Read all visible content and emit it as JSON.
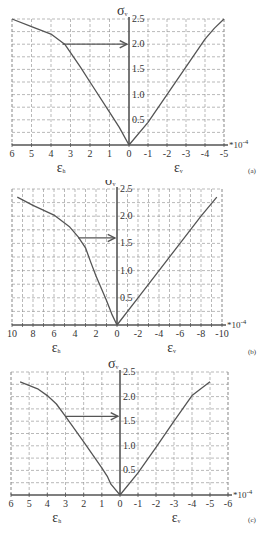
{
  "chart_data": [
    {
      "type": "line",
      "panel": "(a)",
      "title": "",
      "ylabel": "σv",
      "xlabel_left": "εh",
      "xlabel_right": "εv",
      "x_multiplier": "*10^-4",
      "xlim": [
        6,
        -5
      ],
      "ylim": [
        0,
        2.5
      ],
      "x_ticks": [
        6,
        5,
        4,
        3,
        2,
        1,
        0,
        -1,
        -2,
        -3,
        -4,
        -5
      ],
      "y_ticks": [
        0.5,
        1.0,
        1.5,
        2.0,
        2.5
      ],
      "grid": true,
      "grid_x_step": 1,
      "grid_y_step": 0.25,
      "series": [
        {
          "name": "εh",
          "x": [
            6,
            5,
            4,
            3.3,
            2.5,
            2,
            1,
            0.5,
            0
          ],
          "y": [
            2.5,
            2.35,
            2.2,
            2.0,
            1.55,
            1.25,
            0.65,
            0.35,
            0
          ]
        },
        {
          "name": "εv",
          "x": [
            0,
            -1,
            -2,
            -3,
            -4,
            -4.5,
            -5
          ],
          "y": [
            0,
            0.45,
            1.0,
            1.55,
            2.1,
            2.32,
            2.5
          ]
        }
      ],
      "annotations": [
        {
          "type": "arrow",
          "from": [
            3.4,
            2.0
          ],
          "to": [
            0,
            2.0
          ]
        }
      ]
    },
    {
      "type": "line",
      "panel": "(b)",
      "title": "",
      "ylabel": "σv",
      "xlabel_left": "εh",
      "xlabel_right": "εv",
      "x_multiplier": "*10^-4",
      "xlim": [
        10,
        -10
      ],
      "ylim": [
        0,
        2.5
      ],
      "x_ticks": [
        10,
        8,
        6,
        4,
        2,
        0,
        -2,
        -4,
        -6,
        -8,
        -10
      ],
      "y_ticks": [
        0.5,
        1.0,
        1.5,
        2.0,
        2.5
      ],
      "grid": true,
      "grid_x_step": 1,
      "grid_y_step": 0.25,
      "series": [
        {
          "name": "εh",
          "x": [
            9.5,
            8,
            6,
            4.5,
            3.7,
            3,
            2.5,
            2,
            1,
            0.5,
            0
          ],
          "y": [
            2.35,
            2.2,
            2.02,
            1.8,
            1.62,
            1.42,
            1.15,
            0.9,
            0.45,
            0.2,
            0
          ]
        },
        {
          "name": "εv",
          "x": [
            0,
            -2,
            -4,
            -6,
            -8,
            -9.5
          ],
          "y": [
            0,
            0.5,
            1.0,
            1.5,
            2.0,
            2.35
          ]
        }
      ],
      "annotations": [
        {
          "type": "arrow",
          "from": [
            3.7,
            1.6
          ],
          "to": [
            0,
            1.6
          ]
        }
      ]
    },
    {
      "type": "line",
      "panel": "(c)",
      "title": "",
      "ylabel": "σv",
      "xlabel_left": "εh",
      "xlabel_right": "εv",
      "x_multiplier": "*10^-4",
      "xlim": [
        6,
        -6
      ],
      "ylim": [
        0,
        2.5
      ],
      "x_ticks": [
        6,
        5,
        4,
        3,
        2,
        1,
        0,
        -1,
        -2,
        -3,
        -4,
        -5,
        -6
      ],
      "y_ticks": [
        0.5,
        1.0,
        1.5,
        2.0,
        2.5
      ],
      "grid": true,
      "grid_x_step": 1,
      "grid_y_step": 0.25,
      "series": [
        {
          "name": "εh",
          "x": [
            5.5,
            4.5,
            4,
            3.5,
            3,
            2,
            1,
            0.7,
            0.5,
            0
          ],
          "y": [
            2.3,
            2.15,
            2.02,
            1.85,
            1.6,
            1.08,
            0.55,
            0.38,
            0.22,
            0
          ]
        },
        {
          "name": "εv",
          "x": [
            0,
            -1,
            -2,
            -3,
            -4,
            -5
          ],
          "y": [
            0,
            0.45,
            0.97,
            1.5,
            2.02,
            2.3
          ]
        }
      ],
      "annotations": [
        {
          "type": "arrow",
          "from": [
            3.0,
            1.6
          ],
          "to": [
            0,
            1.6
          ]
        }
      ]
    }
  ],
  "labels": {
    "sigma": "σ",
    "sigma_sub": "v",
    "eps": "ε",
    "eps_h_sub": "h",
    "eps_v_sub": "v",
    "multiplier": "*10",
    "multiplier_exp": "-4"
  },
  "layout": [
    {
      "top": 0,
      "height": 180,
      "x_left": 12,
      "x_zero": 129,
      "x_right": 224,
      "y_top": 19,
      "y_zero": 145,
      "tag_y": 173
    },
    {
      "top": 180,
      "height": 180,
      "x_left": 12,
      "x_zero": 117,
      "x_right": 222,
      "y_top": 9,
      "y_zero": 145,
      "tag_y": 174
    },
    {
      "top": 360,
      "height": 182,
      "x_left": 11,
      "x_zero": 120,
      "x_right": 228,
      "y_top": 12,
      "y_zero": 135,
      "tag_y": 162
    }
  ],
  "colors": {
    "curve": "#555555",
    "axis": "#555555",
    "grid": "#8a8a8a",
    "text": "#333333"
  }
}
